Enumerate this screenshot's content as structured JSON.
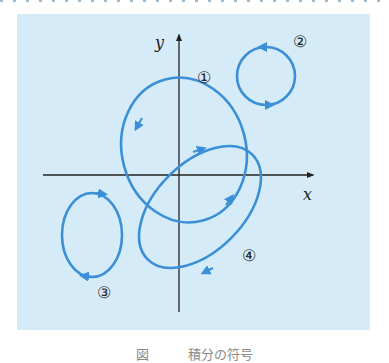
{
  "diagram": {
    "background_color": "#d6ebf8",
    "curve_color": "#3a8fd6",
    "axis_color": "#222222",
    "axes": {
      "x_label": "x",
      "y_label": "y"
    },
    "curves": [
      {
        "id": "1",
        "label": "①",
        "shape": "tilted ellipse around origin",
        "direction": "counterclockwise"
      },
      {
        "id": "2",
        "label": "②",
        "shape": "circle in first quadrant",
        "direction": "counterclockwise"
      },
      {
        "id": "3",
        "label": "③",
        "shape": "ellipse in third quadrant",
        "direction": "clockwise"
      },
      {
        "id": "4",
        "label": "④",
        "shape": "tilted ellipse through origin",
        "direction": "clockwise"
      }
    ]
  },
  "caption": "図　　　積分の符号"
}
